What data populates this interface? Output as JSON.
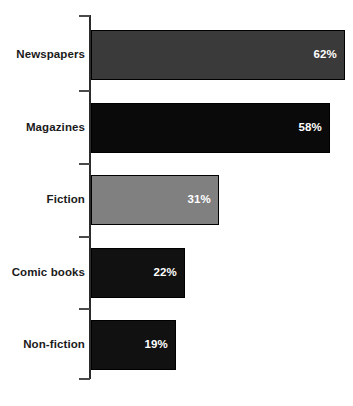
{
  "chart_data": {
    "type": "bar",
    "orientation": "horizontal",
    "title": "",
    "subtitle": "",
    "xlabel": "",
    "ylabel": "",
    "categories": [
      "Newspapers",
      "Magazines",
      "Fiction",
      "Comic books",
      "Non-fiction"
    ],
    "values": [
      62,
      58,
      31,
      22,
      19
    ],
    "value_labels": [
      "62%",
      "58%",
      "31%",
      "22%",
      "19%"
    ],
    "bar_colors": [
      "#3a3a3a",
      "#0a0a0a",
      "#808080",
      "#111111",
      "#111111"
    ],
    "bar_border_color": "#000000",
    "value_label_color": "#ffffff",
    "category_label_color": "#1a1a1a",
    "axis_color": "#2b2b2b",
    "background_color": "#ffffff",
    "xlim": [
      0,
      62
    ],
    "grid": false,
    "legend": null,
    "tick_labels": [],
    "annotations": []
  },
  "bars": [
    {
      "label": "Newspapers",
      "value_label": "62%",
      "value": 62,
      "color": "#3a3a3a",
      "top": 30,
      "height": 50,
      "width": 254
    },
    {
      "label": "Magazines",
      "value_label": "58%",
      "value": 58,
      "color": "#0a0a0a",
      "top": 103,
      "height": 50,
      "width": 239
    },
    {
      "label": "Fiction",
      "value_label": "31%",
      "value": 31,
      "color": "#808080",
      "top": 175,
      "height": 50,
      "width": 128
    },
    {
      "label": "Comic books",
      "value_label": "22%",
      "value": 22,
      "color": "#111111",
      "top": 248,
      "height": 50,
      "width": 94
    },
    {
      "label": "Non-fiction",
      "value_label": "19%",
      "value": 19,
      "color": "#111111",
      "top": 320,
      "height": 50,
      "width": 85
    }
  ],
  "axis": {
    "tick_positions": [
      15,
      90,
      163,
      236,
      308,
      378
    ]
  }
}
